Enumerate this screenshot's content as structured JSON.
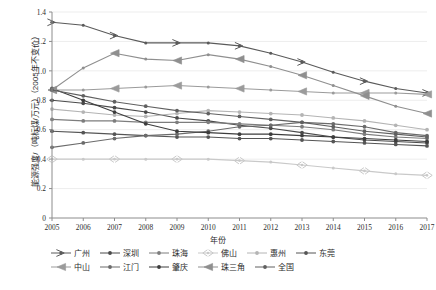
{
  "chart_data": {
    "type": "line",
    "title": "",
    "xlabel": "年份",
    "ylabel": "能源强度/（吨标煤/万元）（2005年不变价）",
    "xlim": [
      2005,
      2017
    ],
    "ylim": [
      0,
      1.4
    ],
    "yticks": [
      "0",
      "0.2",
      "0.4",
      "0.6",
      "0.8",
      "1.0",
      "1.2",
      "1.4"
    ],
    "grid": true,
    "legend_position": "bottom",
    "x": [
      2005,
      2006,
      2007,
      2008,
      2009,
      2010,
      2011,
      2012,
      2013,
      2014,
      2015,
      2016,
      2017
    ],
    "categories": [
      "2005",
      "2006",
      "2007",
      "2008",
      "2009",
      "2010",
      "2011",
      "2012",
      "2013",
      "2014",
      "2015",
      "2016",
      "2017"
    ],
    "series": [
      {
        "name": "广州",
        "marker": "arrow-right",
        "color": "#5a5a5a",
        "values": [
          1.33,
          1.31,
          1.24,
          1.19,
          1.19,
          1.19,
          1.17,
          1.12,
          1.06,
          0.99,
          0.93,
          0.88,
          0.85
        ]
      },
      {
        "name": "深圳",
        "marker": "circle",
        "color": "#4a4a4a",
        "values": [
          0.8,
          0.78,
          0.75,
          0.72,
          0.68,
          0.66,
          0.63,
          0.61,
          0.58,
          0.55,
          0.53,
          0.52,
          0.51
        ]
      },
      {
        "name": "珠海",
        "marker": "circle",
        "color": "#7d7d7d",
        "values": [
          0.67,
          0.66,
          0.66,
          0.65,
          0.65,
          0.65,
          0.64,
          0.63,
          0.62,
          0.6,
          0.57,
          0.55,
          0.54
        ]
      },
      {
        "name": "佛山",
        "marker": "arrow-left-right",
        "color": "#c9c9c9",
        "values": [
          0.4,
          0.4,
          0.4,
          0.4,
          0.4,
          0.4,
          0.39,
          0.38,
          0.36,
          0.34,
          0.32,
          0.3,
          0.29
        ]
      },
      {
        "name": "惠州",
        "marker": "circle",
        "color": "#b4b4b4",
        "values": [
          0.74,
          0.72,
          0.7,
          0.69,
          0.71,
          0.73,
          0.72,
          0.71,
          0.7,
          0.68,
          0.66,
          0.63,
          0.6
        ]
      },
      {
        "name": "东莞",
        "marker": "circle",
        "color": "#555555",
        "values": [
          0.59,
          0.58,
          0.57,
          0.56,
          0.55,
          0.55,
          0.54,
          0.54,
          0.53,
          0.52,
          0.51,
          0.5,
          0.49
        ]
      },
      {
        "name": "中山",
        "marker": "arrow-left",
        "color": "#9b9b9b",
        "values": [
          0.87,
          0.87,
          0.88,
          0.89,
          0.9,
          0.89,
          0.88,
          0.87,
          0.86,
          0.85,
          0.85,
          0.85,
          0.84
        ]
      },
      {
        "name": "江门",
        "marker": "circle",
        "color": "#6b6b6b",
        "values": [
          0.48,
          0.51,
          0.54,
          0.56,
          0.57,
          0.59,
          0.62,
          0.63,
          0.65,
          0.64,
          0.62,
          0.58,
          0.56
        ]
      },
      {
        "name": "肇庆",
        "marker": "circle",
        "color": "#3d3d3d",
        "values": [
          0.88,
          0.8,
          0.72,
          0.64,
          0.59,
          0.58,
          0.57,
          0.57,
          0.56,
          0.55,
          0.54,
          0.53,
          0.52
        ]
      },
      {
        "name": "珠三角",
        "marker": "arrow-left",
        "color": "#8f8f8f",
        "values": [
          0.87,
          1.02,
          1.12,
          1.08,
          1.07,
          1.11,
          1.08,
          1.03,
          0.97,
          0.9,
          0.83,
          0.76,
          0.71
        ]
      },
      {
        "name": "全国",
        "marker": "circle",
        "color": "#606060",
        "values": [
          0.87,
          0.83,
          0.79,
          0.76,
          0.73,
          0.71,
          0.69,
          0.67,
          0.65,
          0.62,
          0.59,
          0.57,
          0.55
        ]
      }
    ]
  }
}
